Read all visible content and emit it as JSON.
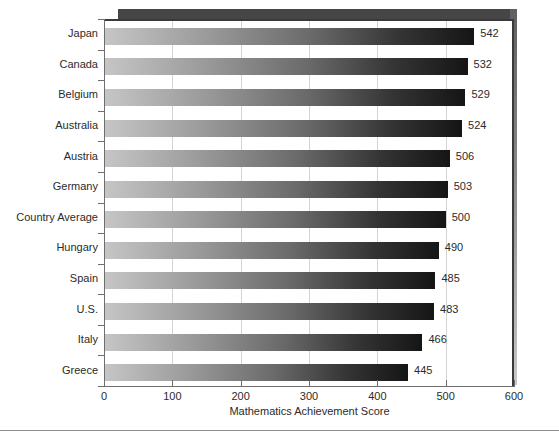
{
  "chart_data": {
    "type": "bar",
    "orientation": "horizontal",
    "title": "",
    "xlabel": "Mathematics Achievement Score",
    "ylabel": "",
    "xlim": [
      0,
      600
    ],
    "xticks": [
      0,
      100,
      200,
      300,
      400,
      500,
      600
    ],
    "xtick_labels": [
      "0",
      "100",
      "200",
      "300",
      "400",
      "500",
      "600"
    ],
    "grid": "vertical",
    "legend": "none",
    "categories": [
      "Japan",
      "Canada",
      "Belgium",
      "Australia",
      "Austria",
      "Germany",
      "Country Average",
      "Hungary",
      "Spain",
      "U.S.",
      "Italy",
      "Greece"
    ],
    "values": [
      542,
      532,
      529,
      524,
      506,
      503,
      500,
      490,
      485,
      483,
      466,
      445
    ],
    "value_labels": [
      "542",
      "532",
      "529",
      "524",
      "506",
      "503",
      "500",
      "490",
      "485",
      "483",
      "466",
      "445"
    ],
    "bar_gradient_from": "#c6c6c6",
    "bar_gradient_to": "#151515",
    "gridline_color": "#d4d4d4",
    "axis_color": "#6e6e6e",
    "frame_color": "#3a3a3a",
    "shadow_color": "#8a8a8a",
    "background": "#ffffff",
    "text_color": "#2b2b2b"
  }
}
